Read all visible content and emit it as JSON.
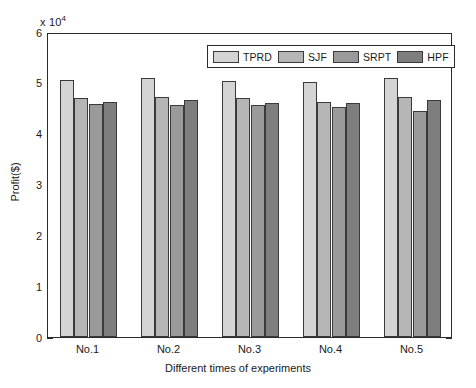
{
  "chart_data": {
    "type": "bar",
    "title": "",
    "subtitle": "",
    "xlabel": "Different times of experiments",
    "ylabel": "Profit($)",
    "y_multiplier_label": "x 10",
    "y_multiplier_exponent": "4",
    "categories": [
      "No.1",
      "No.2",
      "No.3",
      "No.4",
      "No.5"
    ],
    "series": [
      {
        "name": "TPRD",
        "color": "#d4d4d4",
        "values": [
          5.05,
          5.1,
          5.03,
          5.02,
          5.1
        ]
      },
      {
        "name": "SJF",
        "color": "#b6b6b6",
        "values": [
          4.7,
          4.73,
          4.7,
          4.62,
          4.72
        ]
      },
      {
        "name": "SRPT",
        "color": "#9a9a9a",
        "values": [
          4.58,
          4.56,
          4.57,
          4.52,
          4.45
        ]
      },
      {
        "name": "HPF",
        "color": "#7e7e7e",
        "values": [
          4.62,
          4.66,
          4.6,
          4.6,
          4.67
        ]
      }
    ],
    "ylim": [
      0,
      6
    ],
    "yticks": [
      "0",
      "1",
      "2",
      "3",
      "4",
      "5",
      "6"
    ],
    "ytick_values": [
      0,
      1,
      2,
      3,
      4,
      5,
      6
    ],
    "grid": false,
    "legend_position": "top-right-inside",
    "value_scale_note": "values are in units of 10^4 dollars"
  },
  "axes": {
    "box_color": "#2b2b2b",
    "bar_edge_color": "#3a3a3a",
    "background": "#ffffff"
  }
}
